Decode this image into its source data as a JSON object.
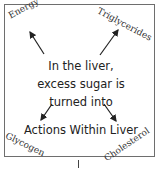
{
  "diagram": {
    "title": "Actions Within Liver",
    "center_lines": [
      "In the liver,",
      "excess sugar is",
      "turned into"
    ],
    "outputs": {
      "top_left": "Energy",
      "top_right": "Triglycerides",
      "bottom_left": "Glycogen",
      "bottom_right": "Cholesterol"
    }
  }
}
